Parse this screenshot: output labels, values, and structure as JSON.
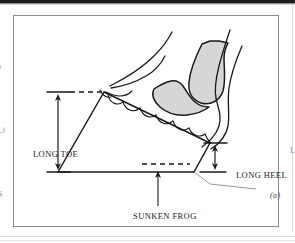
{
  "figure": {
    "caption_marker": "(a)",
    "labels": {
      "long_toe": "LONG TOE",
      "long_heel": "LONG HEEL",
      "sunken_frog": "SUNKEN FROG"
    },
    "bleed_text": {
      "left_top": "n",
      "left_middle": "LC",
      "left_bottom": "S",
      "right_middle": "L"
    },
    "colors": {
      "outline": "#1a1a1a",
      "frame": "#8a8a8a",
      "shading": "#d6d6d6",
      "leader": "#9a9a9a",
      "scan_band": "#1d1d1d",
      "background": "#ffffff"
    }
  }
}
